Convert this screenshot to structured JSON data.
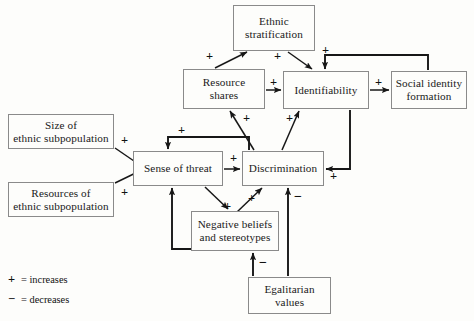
{
  "diagram": {
    "type": "causal-loop-diagram",
    "nodes": [
      {
        "id": "ethnic_stratification",
        "label": "Ethnic\nstratification",
        "x": 233,
        "y": 5,
        "w": 82,
        "h": 46
      },
      {
        "id": "resource_shares",
        "label": "Resource\nshares",
        "x": 183,
        "y": 69,
        "w": 82,
        "h": 40
      },
      {
        "id": "identifiability",
        "label": "Identifiability",
        "x": 283,
        "y": 71,
        "w": 86,
        "h": 38
      },
      {
        "id": "social_identity",
        "label": "Social identity\nformation",
        "x": 391,
        "y": 71,
        "w": 76,
        "h": 38
      },
      {
        "id": "size_subpop",
        "label": "Size of\nethnic subpopulation",
        "x": 8,
        "y": 114,
        "w": 106,
        "h": 35
      },
      {
        "id": "resources_subpop",
        "label": "Resources of\nethnic subpopulation",
        "x": 8,
        "y": 182,
        "w": 106,
        "h": 35
      },
      {
        "id": "sense_of_threat",
        "label": "Sense of threat",
        "x": 133,
        "y": 151,
        "w": 90,
        "h": 35
      },
      {
        "id": "discrimination",
        "label": "Discrimination",
        "x": 242,
        "y": 151,
        "w": 82,
        "h": 35
      },
      {
        "id": "negative_beliefs",
        "label": "Negative beliefs\nand stereotypes",
        "x": 191,
        "y": 211,
        "w": 88,
        "h": 40
      },
      {
        "id": "egalitarian_values",
        "label": "Egalitarian\nvalues",
        "x": 248,
        "y": 277,
        "w": 83,
        "h": 37
      }
    ],
    "edges": [
      {
        "from": "resource_shares",
        "to": "ethnic_stratification",
        "sign": "+"
      },
      {
        "from": "ethnic_stratification",
        "to": "identifiability",
        "sign": "+"
      },
      {
        "from": "resource_shares",
        "to": "identifiability",
        "sign": "+"
      },
      {
        "from": "identifiability",
        "to": "social_identity",
        "sign": "+"
      },
      {
        "from": "social_identity",
        "to": "identifiability",
        "sign": "+"
      },
      {
        "from": "size_subpop",
        "to": "sense_of_threat",
        "sign": "+"
      },
      {
        "from": "resources_subpop",
        "to": "sense_of_threat",
        "sign": "+"
      },
      {
        "from": "sense_of_threat",
        "to": "discrimination",
        "sign": "+"
      },
      {
        "from": "discrimination",
        "to": "sense_of_threat",
        "sign": "+"
      },
      {
        "from": "identifiability",
        "to": "discrimination",
        "sign": "+"
      },
      {
        "from": "discrimination",
        "to": "resource_shares",
        "sign": "+"
      },
      {
        "from": "discrimination",
        "to": "identifiability",
        "sign": "+"
      },
      {
        "from": "sense_of_threat",
        "to": "negative_beliefs",
        "sign": "+"
      },
      {
        "from": "negative_beliefs",
        "to": "discrimination",
        "sign": "+"
      },
      {
        "from": "negative_beliefs",
        "to": "sense_of_threat",
        "sign": "+"
      },
      {
        "from": "egalitarian_values",
        "to": "negative_beliefs",
        "sign": "-"
      },
      {
        "from": "egalitarian_values",
        "to": "discrimination",
        "sign": "-"
      }
    ],
    "signs": [
      {
        "name": "sign-resource-to-stratification",
        "text": "+",
        "x": 206,
        "y": 50
      },
      {
        "name": "sign-stratification-to-identifiability",
        "text": "+",
        "x": 274,
        "y": 50
      },
      {
        "name": "sign-social-identity-feedback",
        "text": "+",
        "x": 322,
        "y": 44
      },
      {
        "name": "sign-resource-to-identifiability",
        "text": "+",
        "x": 270,
        "y": 76
      },
      {
        "name": "sign-identifiability-to-social",
        "text": "+",
        "x": 375,
        "y": 76
      },
      {
        "name": "sign-discrimination-to-resource",
        "text": "+",
        "x": 243,
        "y": 112
      },
      {
        "name": "sign-discrimination-to-identifiability",
        "text": "+",
        "x": 286,
        "y": 112
      },
      {
        "name": "sign-size-to-threat",
        "text": "+",
        "x": 121,
        "y": 134
      },
      {
        "name": "sign-discrimination-feedback-threat",
        "text": "+",
        "x": 178,
        "y": 124
      },
      {
        "name": "sign-threat-to-discrimination",
        "text": "+",
        "x": 230,
        "y": 152
      },
      {
        "name": "sign-identifiability-to-discrimination",
        "text": "+",
        "x": 330,
        "y": 170
      },
      {
        "name": "sign-resources-to-threat",
        "text": "+",
        "x": 121,
        "y": 186
      },
      {
        "name": "sign-threat-to-negative",
        "text": "+",
        "x": 224,
        "y": 200
      },
      {
        "name": "sign-negative-to-discrimination",
        "text": "+",
        "x": 248,
        "y": 192
      },
      {
        "name": "sign-egalitarian-to-discrimination",
        "text": "−",
        "x": 294,
        "y": 190
      },
      {
        "name": "sign-egalitarian-to-negative",
        "text": "−",
        "x": 259,
        "y": 256
      }
    ]
  },
  "legend": {
    "rows": [
      {
        "symbol": "+",
        "text": "= increases"
      },
      {
        "symbol": "−",
        "text": "= decreases"
      }
    ]
  },
  "colors": {
    "box_border": "#8a8a8a",
    "wire": "#171717",
    "background": "#fdfdfb",
    "text": "#1a1a1a"
  }
}
